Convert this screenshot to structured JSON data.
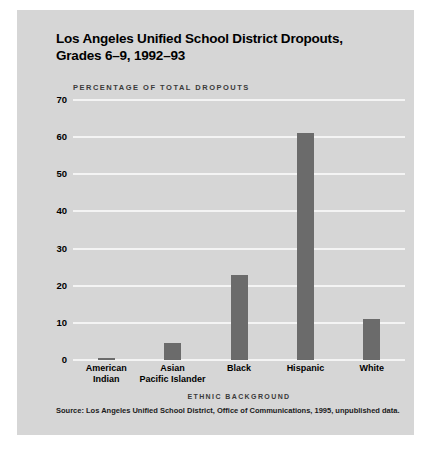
{
  "card": {
    "title_line1": "Los Angeles Unified School District Dropouts,",
    "title_line2": "Grades 6–9, 1992–93",
    "subtitle": "PERCENTAGE OF TOTAL DROPOUTS",
    "source": "Source: Los Angeles Unified School District, Office of Communications, 1995, unpublished data."
  },
  "colors": {
    "card_background": "#d6d6d6",
    "bar": "#6b6b6b",
    "gridline": "#f4f4f4",
    "text": "#000000"
  },
  "chart_data": {
    "type": "bar",
    "title": "Los Angeles Unified School District Dropouts, Grades 6–9, 1992–93",
    "subtitle": "PERCENTAGE OF TOTAL DROPOUTS",
    "categories": [
      "American Indian",
      "Asian Pacific Islander",
      "Black",
      "Hispanic",
      "White"
    ],
    "category_lines": [
      [
        "American",
        "Indian"
      ],
      [
        "Asian",
        "Pacific Islander"
      ],
      [
        "Black",
        ""
      ],
      [
        "Hispanic",
        ""
      ],
      [
        "White",
        ""
      ]
    ],
    "values": [
      0.5,
      4.5,
      23,
      61,
      11
    ],
    "xlabel": "ETHNIC BACKGROUND",
    "ylabel": "PERCENTAGE OF TOTAL DROPOUTS",
    "ylim": [
      0,
      70
    ],
    "yticks": [
      70,
      60,
      50,
      40,
      30,
      20,
      10,
      0
    ],
    "grid": true,
    "legend": "none",
    "source": "Source: Los Angeles Unified School District, Office of Communications, 1995, unpublished data."
  }
}
